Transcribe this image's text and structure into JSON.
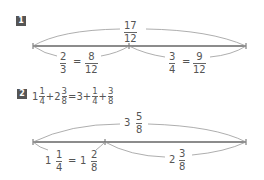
{
  "problem1": {
    "badge": "1",
    "total": {
      "num": "17",
      "den": "12"
    },
    "left": {
      "a_num": "2",
      "a_den": "3",
      "eq": "=",
      "b_num": "8",
      "b_den": "12"
    },
    "right": {
      "a_num": "3",
      "a_den": "4",
      "eq": "=",
      "b_num": "9",
      "b_den": "12"
    }
  },
  "problem2": {
    "badge": "2",
    "equation": {
      "t1_whole": "1",
      "t1_num": "1",
      "t1_den": "4",
      "plus1": "+",
      "t2_whole": "2",
      "t2_num": "3",
      "t2_den": "8",
      "eq": "=",
      "r_whole": "3",
      "plus2": "+",
      "r1_num": "1",
      "r1_den": "4",
      "plus3": "+",
      "r2_num": "3",
      "r2_den": "8"
    },
    "total": {
      "whole": "3",
      "num": "5",
      "den": "8"
    },
    "left": {
      "a_whole": "1",
      "a_num": "1",
      "a_den": "4",
      "eq": "=",
      "b_whole": "1",
      "b_num": "2",
      "b_den": "8"
    },
    "right": {
      "whole": "2",
      "num": "3",
      "den": "8"
    }
  },
  "colors": {
    "line": "#666666",
    "arc": "#999999",
    "badge": "#555555"
  }
}
